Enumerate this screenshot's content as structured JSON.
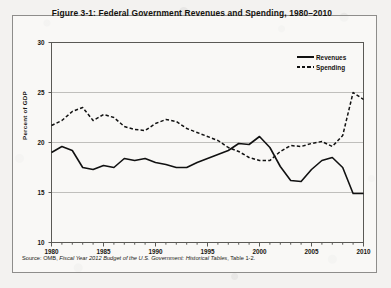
{
  "figure": {
    "title": "Figure 3-1: Federal Government Revenues and Spending, 1980–2010",
    "source_prefix": "Source: OMB, ",
    "source_italic": "Fiscal Year 2012 Budget of the U.S. Government: Historical Tables",
    "source_suffix": ", Table 1-2."
  },
  "legend": {
    "revenues_label": "Revenues",
    "spending_label": "Spending",
    "revenues_style": "solid",
    "spending_style": "dashed"
  },
  "colors": {
    "line": "#111111",
    "grid": "#b9b8b5",
    "axis": "#5a5955",
    "page": "#f3f2f0",
    "frame": "#8e8d8b"
  },
  "chart_data": {
    "type": "line",
    "title": "Figure 3-1: Federal Government Revenues and Spending, 1980–2010",
    "xlabel": "",
    "ylabel": "Percent of GDP",
    "xlim": [
      1980,
      2010
    ],
    "ylim": [
      10,
      30
    ],
    "yticks": [
      10,
      15,
      20,
      25,
      30
    ],
    "ytick_labels": [
      "10",
      "15",
      "20",
      "25",
      "30"
    ],
    "xticks": [
      1980,
      1985,
      1990,
      1995,
      2000,
      2005,
      2010
    ],
    "xtick_labels": [
      "1980",
      "1985",
      "1990",
      "1995",
      "2000",
      "2005",
      "2010"
    ],
    "grid": true,
    "legend_position": "top-right",
    "x": [
      1980,
      1981,
      1982,
      1983,
      1984,
      1985,
      1986,
      1987,
      1988,
      1989,
      1990,
      1991,
      1992,
      1993,
      1994,
      1995,
      1996,
      1997,
      1998,
      1999,
      2000,
      2001,
      2002,
      2003,
      2004,
      2005,
      2006,
      2007,
      2008,
      2009,
      2010
    ],
    "series": [
      {
        "name": "Revenues",
        "style": "solid",
        "values": [
          19.0,
          19.6,
          19.2,
          17.5,
          17.3,
          17.7,
          17.5,
          18.4,
          18.2,
          18.4,
          18.0,
          17.8,
          17.5,
          17.5,
          18.0,
          18.4,
          18.8,
          19.2,
          19.9,
          19.8,
          20.6,
          19.5,
          17.6,
          16.2,
          16.1,
          17.3,
          18.2,
          18.5,
          17.5,
          14.9,
          14.9
        ]
      },
      {
        "name": "Spending",
        "style": "dashed",
        "values": [
          21.7,
          22.2,
          23.1,
          23.5,
          22.2,
          22.8,
          22.5,
          21.6,
          21.3,
          21.2,
          21.9,
          22.3,
          22.1,
          21.4,
          21.0,
          20.6,
          20.2,
          19.5,
          19.1,
          18.5,
          18.2,
          18.2,
          19.1,
          19.7,
          19.6,
          19.9,
          20.1,
          19.6,
          20.7,
          25.0,
          24.3
        ]
      }
    ],
    "annotations": [
      {
        "text": "Revenues exceed spending 1998–2001 (surplus)",
        "x_range": [
          1998,
          2001
        ]
      },
      {
        "text": "Spending spikes to 25.0% of GDP in 2009",
        "x": 2009
      }
    ]
  }
}
